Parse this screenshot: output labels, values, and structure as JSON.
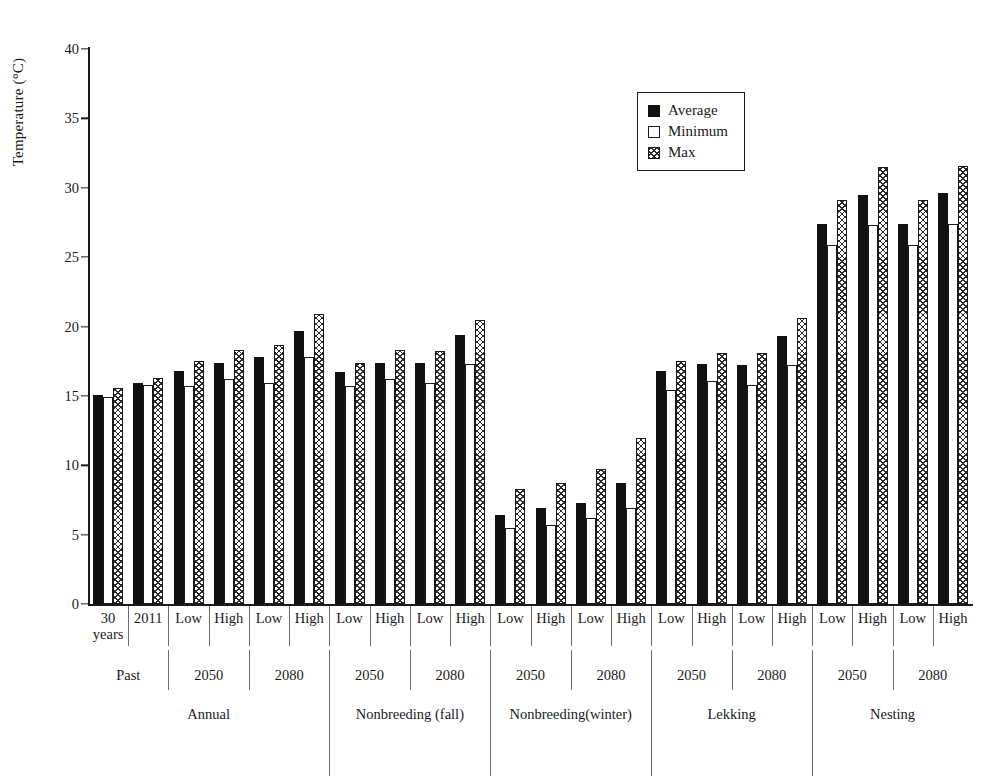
{
  "chart_data": {
    "type": "bar",
    "title": "",
    "xlabel": "",
    "ylabel": "Temperature (°C)",
    "ylim": [
      0,
      40
    ],
    "yticks": [
      0,
      5,
      10,
      15,
      20,
      25,
      30,
      35,
      40
    ],
    "grid": false,
    "legend_position": "top-right",
    "legend": [
      "Average",
      "Minimum",
      "Max"
    ],
    "series": [
      {
        "name": "Average",
        "values": [
          15.1,
          15.9,
          16.8,
          17.4,
          17.8,
          19.7,
          16.7,
          17.4,
          17.4,
          19.4,
          6.4,
          6.9,
          7.3,
          8.7,
          16.8,
          17.3,
          17.2,
          19.3,
          27.4,
          29.5,
          27.4,
          29.6
        ]
      },
      {
        "name": "Minimum",
        "values": [
          14.9,
          15.8,
          15.7,
          16.2,
          15.9,
          17.8,
          15.7,
          16.2,
          15.9,
          17.3,
          5.5,
          5.7,
          6.2,
          6.9,
          15.4,
          16.1,
          15.8,
          17.2,
          25.9,
          27.3,
          25.9,
          27.4
        ]
      },
      {
        "name": "Max",
        "values": [
          15.6,
          16.3,
          17.5,
          18.3,
          18.7,
          20.9,
          17.4,
          18.3,
          18.2,
          20.5,
          8.3,
          8.7,
          9.7,
          12.0,
          17.5,
          18.1,
          18.1,
          20.6,
          29.1,
          31.5,
          29.1,
          31.6
        ]
      }
    ],
    "categories": [
      "30 years",
      "2011",
      "Low",
      "High",
      "Low",
      "High",
      "Low",
      "High",
      "Low",
      "High",
      "Low",
      "High",
      "Low",
      "High",
      "Low",
      "High",
      "Low",
      "High",
      "Low",
      "High",
      "Low",
      "High"
    ],
    "tier2": [
      {
        "label": "Past",
        "span": 2
      },
      {
        "label": "2050",
        "span": 2
      },
      {
        "label": "2080",
        "span": 2
      },
      {
        "label": "2050",
        "span": 2
      },
      {
        "label": "2080",
        "span": 2
      },
      {
        "label": "2050",
        "span": 2
      },
      {
        "label": "2080",
        "span": 2
      },
      {
        "label": "2050",
        "span": 2
      },
      {
        "label": "2080",
        "span": 2
      },
      {
        "label": "2050",
        "span": 2
      },
      {
        "label": "2080",
        "span": 2
      }
    ],
    "tier3": [
      {
        "label": "Annual",
        "span": 6
      },
      {
        "label": "Nonbreeding (fall)",
        "span": 4
      },
      {
        "label": "Nonbreeding\n(winter)",
        "span": 4
      },
      {
        "label": "Lekking",
        "span": 4
      },
      {
        "label": "Nesting",
        "span": 4
      }
    ]
  },
  "colors": {
    "average": "#111111",
    "minimum": "#ffffff",
    "max_hatch": "#2a2a2a",
    "axis": "#1a1a1a",
    "separator": "#6e6e6e"
  }
}
